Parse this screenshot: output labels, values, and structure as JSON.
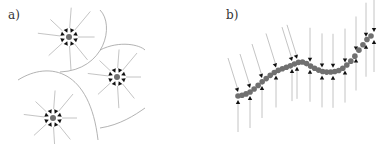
{
  "panels": [
    {
      "label": "a)",
      "label_pos": [
        8,
        8
      ],
      "sinks": [
        {
          "cx": 69,
          "cy": 37,
          "rays": 8,
          "ray_len": 32
        },
        {
          "cx": 117,
          "cy": 77,
          "rays": 8,
          "ray_len": 30
        },
        {
          "cx": 53,
          "cy": 118,
          "rays": 8,
          "ray_len": 30
        }
      ],
      "boundaries": [
        "M 100 10 C 115 25, 105 70, 60 72",
        "M 18 80 C 50 60, 90 70, 98 140",
        "M 100 50 C 120 40, 140 45, 145 50",
        "M 100 128 C 120 125, 135 115, 145 108"
      ]
    },
    {
      "label": "b)",
      "label_pos": [
        226,
        8
      ],
      "chain": {
        "x0": 238,
        "x1": 371,
        "points": [
          [
            238,
            96
          ],
          [
            250,
            92
          ],
          [
            262,
            82
          ],
          [
            275,
            72
          ],
          [
            290,
            66
          ],
          [
            302,
            62
          ],
          [
            314,
            68
          ],
          [
            325,
            72
          ],
          [
            340,
            70
          ],
          [
            352,
            60
          ],
          [
            362,
            46
          ],
          [
            371,
            36
          ]
        ],
        "dot_count": 34,
        "arrow_xs": [
          238,
          250,
          262,
          276,
          292,
          297,
          310,
          322,
          333,
          345,
          356,
          366,
          374
        ]
      }
    }
  ],
  "colors": {
    "ray": "#bdbdbd",
    "arrow": "#111111",
    "dot": "#707070",
    "boundary": "#a0a0a0"
  }
}
